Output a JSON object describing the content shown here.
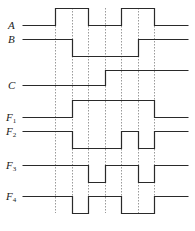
{
  "diagram": {
    "type": "timing-diagram",
    "signals": [
      {
        "name": "A",
        "sub": "",
        "high_y": 8,
        "low_y": 25,
        "initial": "low",
        "transitions": [
          55,
          88,
          121,
          154
        ]
      },
      {
        "name": "B",
        "sub": "",
        "high_y": 39,
        "low_y": 56,
        "initial": "high",
        "transitions": [
          72,
          138
        ]
      },
      {
        "name": "C",
        "sub": "",
        "high_y": 70,
        "low_y": 85,
        "initial": "low",
        "transitions": [
          105
        ]
      },
      {
        "name": "F",
        "sub": "1",
        "high_y": 100,
        "low_y": 117,
        "initial": "low",
        "transitions": [
          72,
          154
        ]
      },
      {
        "name": "F",
        "sub": "2",
        "high_y": 131,
        "low_y": 148,
        "initial": "high",
        "transitions": [
          72,
          121,
          138,
          154
        ]
      },
      {
        "name": "F",
        "sub": "3",
        "high_y": 165,
        "low_y": 182,
        "initial": "high",
        "transitions": [
          88,
          105,
          138,
          154
        ]
      },
      {
        "name": "F",
        "sub": "4",
        "high_y": 196,
        "low_y": 213,
        "initial": "high",
        "transitions": [
          72,
          88,
          121,
          154
        ]
      }
    ],
    "x_start": 22,
    "x_end": 188,
    "guide_lines_x": [
      55,
      72,
      88,
      105,
      121,
      138,
      154
    ],
    "guide_top": 8,
    "guide_bottom": 213,
    "colors": {
      "signal": "#2a2a2a",
      "guide": "#555555"
    }
  },
  "labels": [
    {
      "text": "A",
      "sub": "",
      "y": 20
    },
    {
      "text": "B",
      "sub": "",
      "y": 34
    },
    {
      "text": "C",
      "sub": "",
      "y": 80
    },
    {
      "text": "F",
      "sub": "1",
      "y": 112
    },
    {
      "text": "F",
      "sub": "2",
      "y": 126
    },
    {
      "text": "F",
      "sub": "3",
      "y": 160
    },
    {
      "text": "F",
      "sub": "4",
      "y": 191
    }
  ]
}
